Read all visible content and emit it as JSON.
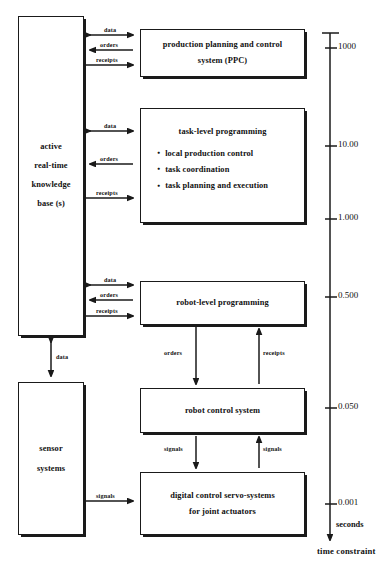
{
  "diagram": {
    "ink_color": "#1a1a1a",
    "background": "#ffffff"
  },
  "blocks": {
    "knowledge_base": {
      "lines": [
        "active",
        "real-time",
        "knowledge",
        "base (s)"
      ]
    },
    "sensor_systems": {
      "lines": [
        "sensor",
        "systems"
      ]
    },
    "ppc": {
      "lines": [
        "production planning and control",
        "system   (PPC)"
      ]
    },
    "task_level": {
      "title": "task-level programming",
      "bullets": [
        "local production control",
        "task coordination",
        "task planning and execution"
      ]
    },
    "robot_level": {
      "lines": [
        "robot-level programming"
      ]
    },
    "robot_control": {
      "lines": [
        "robot control system"
      ]
    },
    "servo": {
      "lines": [
        "digital control servo-systems",
        "for joint actuators"
      ]
    }
  },
  "edges": {
    "ppc_data": "data",
    "ppc_orders": "orders",
    "ppc_receipts": "receipts",
    "task_data": "data",
    "task_orders": "orders",
    "task_receipts": "receipts",
    "robot_data": "data",
    "robot_orders": "orders",
    "robot_receipts": "receipts",
    "kb_sensor_data": "data",
    "rl_to_rcs_orders": "orders",
    "rcs_to_rl_receipts": "receipts",
    "rcs_to_servo_signals": "signals",
    "servo_to_rcs_signals": "signals",
    "sensor_signals": "signals"
  },
  "time_axis": {
    "unit_label": "seconds",
    "caption": "time constraint",
    "ticks": [
      {
        "value": "1000",
        "y": 48
      },
      {
        "value": "10.00",
        "y": 146
      },
      {
        "value": "1.000",
        "y": 219
      },
      {
        "value": "0.500",
        "y": 297
      },
      {
        "value": "0.050",
        "y": 408
      },
      {
        "value": "0.001",
        "y": 504
      }
    ]
  }
}
